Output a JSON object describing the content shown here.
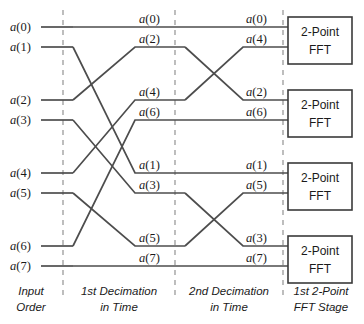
{
  "figure": {
    "width": 364,
    "height": 324,
    "background_color": "#ffffff",
    "line_color": "#4d4d4d",
    "divider_color": "#9b9b9b",
    "box_stroke_color": "#3a3a3a"
  },
  "columns": [
    {
      "id": "input-order",
      "caption_line1": "Input",
      "caption_line2": "Order"
    },
    {
      "id": "first-decimation",
      "caption_line1": "1st Decimation",
      "caption_line2": "in Time"
    },
    {
      "id": "second-decimation",
      "caption_line1": "2nd Decimation",
      "caption_line2": "in Time"
    },
    {
      "id": "first-fft-stage",
      "caption_line1": "1st 2-Point",
      "caption_line2": "FFT Stage"
    }
  ],
  "input_labels": [
    "a(0)",
    "a(1)",
    "a(2)",
    "a(3)",
    "a(4)",
    "a(5)",
    "a(6)",
    "a(7)"
  ],
  "stage1_labels": [
    "a(0)",
    "a(2)",
    "a(4)",
    "a(6)",
    "a(1)",
    "a(3)",
    "a(5)",
    "a(7)"
  ],
  "stage2_labels": [
    "a(0)",
    "a(4)",
    "a(2)",
    "a(6)",
    "a(1)",
    "a(5)",
    "a(3)",
    "a(7)"
  ],
  "fft_blocks": [
    {
      "line1": "2-Point",
      "line2": "FFT",
      "inputs": [
        "a(0)",
        "a(4)"
      ]
    },
    {
      "line1": "2-Point",
      "line2": "FFT",
      "inputs": [
        "a(2)",
        "a(6)"
      ]
    },
    {
      "line1": "2-Point",
      "line2": "FFT",
      "inputs": [
        "a(1)",
        "a(5)"
      ]
    },
    {
      "line1": "2-Point",
      "line2": "FFT",
      "inputs": [
        "a(3)",
        "a(7)"
      ]
    }
  ],
  "routing": {
    "stage1_permutation": [
      0,
      4,
      1,
      5,
      2,
      6,
      3,
      7
    ],
    "stage2_permutation": [
      0,
      2,
      1,
      3,
      4,
      6,
      5,
      7
    ],
    "note": "input row index -> output row index for each decimation stage"
  },
  "geometry": {
    "row_y": [
      27,
      47,
      100,
      120,
      173,
      193,
      246,
      266
    ],
    "divider_x": [
      63,
      175,
      283
    ],
    "line_start_x": 41,
    "box_left": 288,
    "box_right": 352,
    "box_heights": [
      17,
      90,
      163,
      236
    ],
    "box_height": 47
  }
}
